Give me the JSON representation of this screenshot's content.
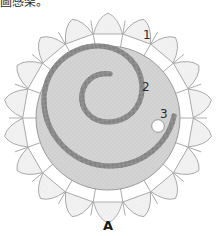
{
  "figure": {
    "top_caption_text": "圖感架。",
    "panel_letter": "A",
    "callouts": [
      {
        "id": "1",
        "label": "1",
        "target": "scalloped-rim-petal"
      },
      {
        "id": "2",
        "label": "2",
        "target": "spiral-rope-cord"
      },
      {
        "id": "3",
        "label": "3",
        "target": "perforation-hole"
      }
    ],
    "object": {
      "name": "scalloped-disk-artifact",
      "rim": {
        "petal_count": 18,
        "outline_color": "#9a9a9a",
        "fill_color": "#f2f2f2"
      },
      "body": {
        "fill_color": "#d2d2d2",
        "texture": "stippled",
        "outline_color": "#9a9a9a"
      },
      "spiral": {
        "type": "archimedean-rope-coil",
        "turns": 2,
        "rope_color": "#8f8f8f",
        "rope_highlight": "#c9c9c9"
      },
      "hole": {
        "fill_color": "#ffffff",
        "outline_color": "#8c8c8c",
        "cx": 158,
        "cy": 126,
        "r": 6
      }
    },
    "colors": {
      "ink": "#2a2a2a",
      "body_grey": "#d2d2d2",
      "rim_grey": "#f2f2f2",
      "line_grey": "#9a9a9a",
      "paper": "#ffffff"
    }
  }
}
